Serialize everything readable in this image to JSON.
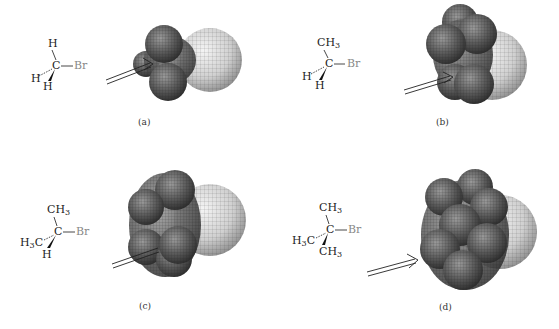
{
  "figure": {
    "panels": [
      {
        "id": "a",
        "caption": "(a)",
        "formula": {
          "top": "H",
          "center": "C",
          "right": "Br",
          "left": "H",
          "bottom": "H"
        },
        "compound": "bromomethane"
      },
      {
        "id": "b",
        "caption": "(b)",
        "formula": {
          "top": "CH",
          "top_sub": "3",
          "center": "C",
          "right": "Br",
          "left": "H",
          "bottom": "H"
        },
        "compound": "bromoethane"
      },
      {
        "id": "c",
        "caption": "(c)",
        "formula": {
          "top": "CH",
          "top_sub": "3",
          "center": "C",
          "right": "Br",
          "left_pre": "H",
          "left_sub": "3",
          "left_post": "C",
          "bottom": "H"
        },
        "compound": "2-bromopropane"
      },
      {
        "id": "d",
        "caption": "(d)",
        "formula": {
          "top": "CH",
          "top_sub": "3",
          "center": "C",
          "right": "Br",
          "left_pre": "H",
          "left_sub": "3",
          "left_post": "C",
          "bottom": "CH",
          "bottom_sub": "3"
        },
        "compound": "2-bromo-2-methylpropane"
      }
    ],
    "colors": {
      "bromine_sphere": "#d8d8d8",
      "hydrogen_carbon_spheres": "#5a5a5a",
      "wire_grid": "#222222",
      "bromine_label": "#888888"
    }
  }
}
